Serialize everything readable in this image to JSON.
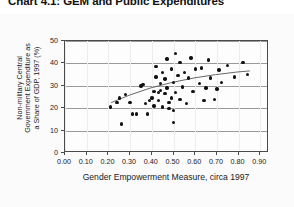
{
  "title": "Chart 4.1: GEM and Public Expenditures",
  "axes": {
    "xlabel": "Gender Empowerment Measure, circa 1997",
    "ylabel_lines": [
      "Non-military Central",
      "Government Expenditure as",
      "a Share of GDP, 1997 (%)"
    ],
    "xticks": [
      "0.00",
      "0.10",
      "0.20",
      "0.30",
      "0.40",
      "0.50",
      "0.60",
      "0.70",
      "0.80",
      "0.90"
    ],
    "yticks": [
      "0",
      "10",
      "20",
      "30",
      "40",
      "50"
    ]
  },
  "colors": {
    "point": "#111111",
    "frame": "#4a4a4a",
    "gridline": "#9a9a9a",
    "trend": "#555555",
    "background": "#ffffff",
    "panel": "#fbfbfb"
  },
  "chart_data": {
    "type": "scatter",
    "title": "Chart 4.1: GEM and Public Expenditures",
    "xlabel": "Gender Empowerment Measure, circa 1997",
    "ylabel": "Non-military Central Government Expenditure as a Share of GDP, 1997 (%)",
    "xlim": [
      0.0,
      0.94
    ],
    "ylim": [
      0,
      50
    ],
    "xticks": [
      0.0,
      0.1,
      0.2,
      0.3,
      0.4,
      0.5,
      0.6,
      0.7,
      0.8,
      0.9
    ],
    "yticks": [
      0,
      10,
      20,
      30,
      40,
      50
    ],
    "grid": "horizontal",
    "legend": "none",
    "points": [
      [
        0.21,
        20.5
      ],
      [
        0.24,
        22.5
      ],
      [
        0.25,
        24.5
      ],
      [
        0.26,
        13.0
      ],
      [
        0.28,
        26.0
      ],
      [
        0.3,
        22.5
      ],
      [
        0.31,
        17.5
      ],
      [
        0.33,
        17.5
      ],
      [
        0.35,
        30.0
      ],
      [
        0.36,
        30.5
      ],
      [
        0.37,
        22.0
      ],
      [
        0.38,
        17.5
      ],
      [
        0.39,
        23.5
      ],
      [
        0.4,
        24.5
      ],
      [
        0.41,
        27.5
      ],
      [
        0.41,
        21.0
      ],
      [
        0.42,
        34.0
      ],
      [
        0.42,
        38.5
      ],
      [
        0.43,
        27.0
      ],
      [
        0.43,
        23.5
      ],
      [
        0.44,
        31.0
      ],
      [
        0.44,
        28.0
      ],
      [
        0.45,
        36.0
      ],
      [
        0.45,
        20.5
      ],
      [
        0.46,
        33.0
      ],
      [
        0.46,
        26.5
      ],
      [
        0.47,
        42.0
      ],
      [
        0.47,
        29.0
      ],
      [
        0.48,
        22.5
      ],
      [
        0.48,
        20.0
      ],
      [
        0.49,
        37.5
      ],
      [
        0.49,
        24.5
      ],
      [
        0.5,
        31.5
      ],
      [
        0.5,
        19.0
      ],
      [
        0.5,
        13.5
      ],
      [
        0.51,
        44.5
      ],
      [
        0.51,
        27.0
      ],
      [
        0.52,
        34.5
      ],
      [
        0.53,
        40.5
      ],
      [
        0.53,
        24.0
      ],
      [
        0.54,
        29.5
      ],
      [
        0.55,
        36.0
      ],
      [
        0.56,
        22.0
      ],
      [
        0.57,
        33.5
      ],
      [
        0.58,
        42.5
      ],
      [
        0.59,
        27.5
      ],
      [
        0.6,
        37.5
      ],
      [
        0.62,
        31.0
      ],
      [
        0.63,
        38.0
      ],
      [
        0.64,
        23.5
      ],
      [
        0.65,
        29.0
      ],
      [
        0.66,
        41.5
      ],
      [
        0.67,
        33.5
      ],
      [
        0.69,
        24.0
      ],
      [
        0.7,
        28.5
      ],
      [
        0.71,
        37.0
      ],
      [
        0.72,
        31.5
      ],
      [
        0.75,
        39.0
      ],
      [
        0.78,
        34.0
      ],
      [
        0.82,
        40.5
      ],
      [
        0.84,
        35.0
      ]
    ],
    "trend": {
      "type": "fitted-curve",
      "points": [
        [
          0.215,
          22.0
        ],
        [
          0.3,
          25.4
        ],
        [
          0.4,
          28.7
        ],
        [
          0.5,
          31.2
        ],
        [
          0.6,
          33.2
        ],
        [
          0.7,
          34.7
        ],
        [
          0.8,
          35.9
        ],
        [
          0.86,
          36.4
        ]
      ]
    }
  }
}
